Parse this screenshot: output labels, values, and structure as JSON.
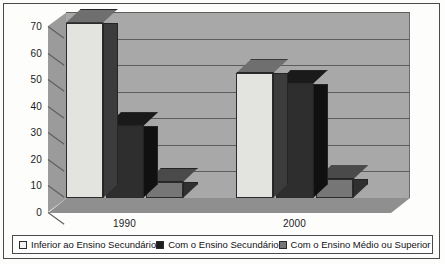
{
  "chart_data": {
    "type": "bar",
    "title": "",
    "subtitle": "",
    "xlabel": "",
    "ylabel": "",
    "categories": [
      "1990",
      "2000"
    ],
    "yticks": [
      0,
      10,
      20,
      30,
      40,
      50,
      60,
      70
    ],
    "ylim": [
      0,
      70
    ],
    "grid": true,
    "legend_position": "bottom",
    "projection": "3d",
    "series": [
      {
        "name": "Inferior ao Ensino Secundário",
        "color": "#e3e3e0",
        "swatch": "#f2f2f0",
        "values": [
          66,
          47
        ]
      },
      {
        "name": "Com o Ensino Secundário",
        "color": "#2e2e2e",
        "swatch": "#1d1d1d",
        "values": [
          27,
          43
        ]
      },
      {
        "name": "Com o Ensino Médio ou Superior",
        "color": "#767676",
        "swatch": "#767676",
        "values": [
          6,
          7
        ]
      }
    ]
  },
  "axis": {
    "y_tick_labels": [
      "0",
      "10",
      "20",
      "30",
      "40",
      "50",
      "60",
      "70"
    ],
    "x_tick_labels": [
      "1990",
      "2000"
    ]
  },
  "legend": {
    "items": [
      {
        "label": "Inferior ao Ensino Secundário"
      },
      {
        "label": "Com o Ensino Secundário"
      },
      {
        "label": "Com o Ensino Médio ou Superior"
      }
    ]
  }
}
